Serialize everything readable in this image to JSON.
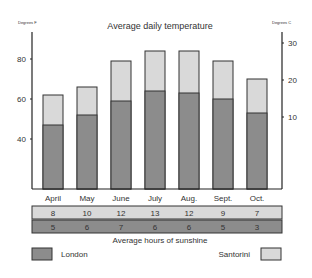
{
  "chart_data": {
    "type": "bar",
    "title": "Average daily temperature",
    "ylabel_left": "Degrees F",
    "ylabel_right": "Degrees C",
    "categories": [
      "April",
      "May",
      "June",
      "July",
      "Aug.",
      "Sept.",
      "Oct."
    ],
    "series": [
      {
        "name": "London",
        "values": [
          47,
          52,
          59,
          64,
          63,
          60,
          53
        ],
        "color": "#8c8c8c"
      },
      {
        "name": "Santorini",
        "values": [
          62,
          66,
          79,
          84,
          84,
          79,
          70
        ],
        "color": "#d9d9d9"
      }
    ],
    "yticks_left": [
      40,
      60,
      80
    ],
    "yticks_right": [
      10,
      20,
      30
    ],
    "ylim_left": [
      14,
      95
    ],
    "sunshine_table": {
      "title": "Average hours of sunshine",
      "Santorini": [
        8,
        10,
        12,
        13,
        12,
        9,
        7
      ],
      "London": [
        5,
        6,
        7,
        6,
        6,
        5,
        3
      ]
    },
    "legend": [
      "London",
      "Santorini"
    ],
    "legend_position": "bottom",
    "grid": false
  },
  "labels": {
    "title": "Average daily temperature",
    "left_unit": "Degrees F",
    "right_unit": "Degrees C",
    "sunshine_title": "Average hours of sunshine",
    "legend_london": "London",
    "legend_santorini": "Santorini"
  }
}
